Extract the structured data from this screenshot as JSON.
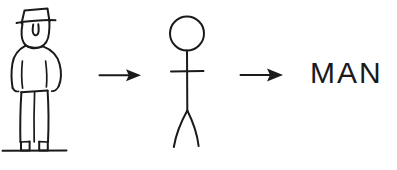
{
  "diagram": {
    "background_color": "#ffffff",
    "ink_color": "#1a1a1a",
    "width": 397,
    "height": 170,
    "stages": [
      {
        "id": "realistic-man",
        "label": "Drawing of a man wearing a hat",
        "kind": "illustration",
        "parts": [
          "hat",
          "face",
          "nose",
          "coat",
          "arms",
          "pants",
          "belt",
          "shoes",
          "ground-line"
        ]
      },
      {
        "id": "stick-figure",
        "label": "Stick figure",
        "kind": "illustration",
        "parts": [
          "head-circle",
          "spine",
          "arms-bar",
          "legs"
        ]
      },
      {
        "id": "word",
        "label": "MAN",
        "kind": "text"
      }
    ],
    "arrows": [
      {
        "id": "arrow-1",
        "label": "leads to",
        "direction": "right"
      },
      {
        "id": "arrow-2",
        "label": "leads to",
        "direction": "right"
      }
    ]
  }
}
